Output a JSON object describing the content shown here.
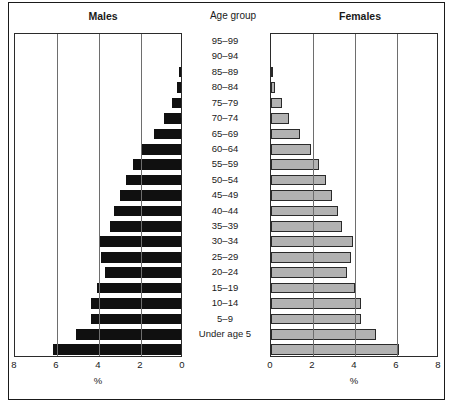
{
  "headings": {
    "males": "Males",
    "age_group": "Age group",
    "females": "Females"
  },
  "axis": {
    "males_ticks": [
      "8",
      "6",
      "4",
      "2",
      "0"
    ],
    "females_ticks": [
      "0",
      "2",
      "4",
      "6",
      "8"
    ],
    "unit_label": "%"
  },
  "colors": {
    "male_bar": "#101010",
    "female_bar": "#b2b2b2",
    "bar_border": "#2a2a2a",
    "gridline": "#6e6e6e",
    "frame": "#1a1a1a",
    "background": "#ffffff"
  },
  "chart_data": {
    "type": "bar",
    "subtype": "population-pyramid",
    "orientation": "horizontal",
    "xlabel": "%",
    "ylabel": "Age group",
    "xlim": [
      0,
      8
    ],
    "xticks": [
      0,
      2,
      4,
      6,
      8
    ],
    "grid": true,
    "legend_position": "none",
    "categories": [
      "95–99",
      "90–94",
      "85–89",
      "80–84",
      "75–79",
      "70–74",
      "65–69",
      "60–64",
      "55–59",
      "50–54",
      "45–49",
      "40–44",
      "35–39",
      "30–34",
      "25–29",
      "20–24",
      "15–19",
      "10–14",
      "5–9",
      "Under age 5"
    ],
    "series": [
      {
        "name": "Males",
        "side": "left",
        "values": [
          0.0,
          0.05,
          0.2,
          0.45,
          0.8,
          1.3,
          1.9,
          2.3,
          2.6,
          2.9,
          3.2,
          3.4,
          3.9,
          3.8,
          3.6,
          4.0,
          4.3,
          4.3,
          5.0,
          6.1
        ]
      },
      {
        "name": "Females",
        "side": "right",
        "values": [
          0.0,
          0.05,
          0.2,
          0.5,
          0.85,
          1.4,
          1.9,
          2.3,
          2.6,
          2.9,
          3.2,
          3.4,
          3.9,
          3.8,
          3.6,
          4.0,
          4.3,
          4.3,
          5.0,
          6.1
        ]
      }
    ]
  }
}
